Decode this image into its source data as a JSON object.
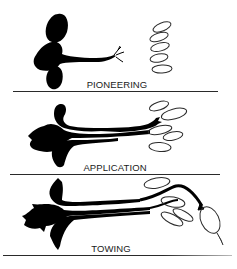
{
  "figure": {
    "panels": [
      {
        "label": "PIONEERING",
        "description": "single lead process extending with branched tip toward cluster of stacked elliptical cells"
      },
      {
        "label": "APPLICATION",
        "description": "lead process contacts elliptical cells; additional processes follow alongside"
      },
      {
        "label": "TOWING",
        "description": "bundled processes pulled along by lead process attached to displaced elliptical cell"
      }
    ],
    "colors": {
      "ink": "#000000",
      "outline": "#2a2a2a",
      "background": "#ffffff"
    }
  }
}
